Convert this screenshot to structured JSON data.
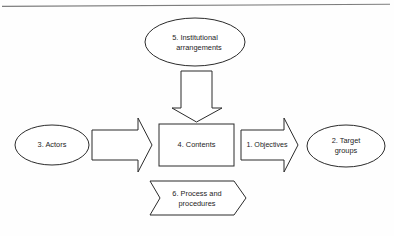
{
  "figure": {
    "background_color": "#fefefe",
    "line_color": "#2b2b2b",
    "rule_color": "#7d7d7d",
    "nodes": {
      "institutional": {
        "line1": "5. Institutional",
        "line2": "arrangements"
      },
      "actors": {
        "line1": "3. Actors"
      },
      "contents": {
        "line1": "4. Contents"
      },
      "objectives": {
        "line1": "1. Objectives"
      },
      "target_groups": {
        "line1": "2. Target",
        "line2": "groups"
      },
      "process": {
        "line1": "6. Process and",
        "line2": "procedures"
      }
    }
  }
}
